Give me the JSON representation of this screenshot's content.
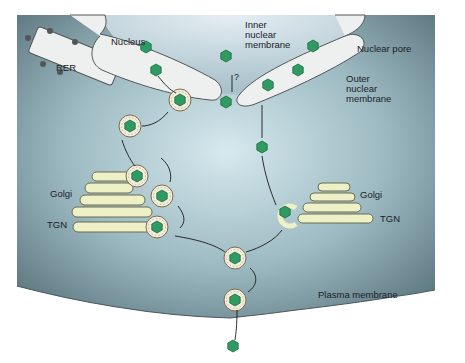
{
  "diagram": {
    "type": "cell-biology-pathway",
    "labels": {
      "nucleus": "Nucleus",
      "rer": "RER",
      "inner_membrane": "Inner\nnuclear\nmembrane",
      "nuclear_pore": "Nuclear pore",
      "outer_membrane": "Outer\nnuclear\nmembrane",
      "golgi_left": "Golgi",
      "tgn_left": "TGN",
      "golgi_right": "Golgi",
      "tgn_right": "TGN",
      "plasma_membrane": "Plasma membrane",
      "question_mark": "?"
    },
    "pathways": [
      {
        "name": "envelopment-deenvelopment-reenvelopment",
        "steps": [
          "nuclear budding",
          "perinuclear vesicle",
          "Golgi/TGN",
          "secretory vesicle",
          "exocytosis"
        ]
      },
      {
        "name": "nuclear-pore-route",
        "steps": [
          "nuclear pore (?)",
          "cytoplasmic capsid",
          "TGN envelopment",
          "secretory vesicle",
          "exocytosis"
        ]
      }
    ],
    "colors": {
      "cytoplasm_dark": "#5f7a82",
      "cytoplasm_light": "#c9e0e6",
      "nucleus_bg": "#d2e3ea",
      "membrane_fill": "#eef0ef",
      "golgi_fill": "#eef0c6",
      "capsid": "#2f9b62",
      "spike": "#8b5a2b"
    }
  }
}
